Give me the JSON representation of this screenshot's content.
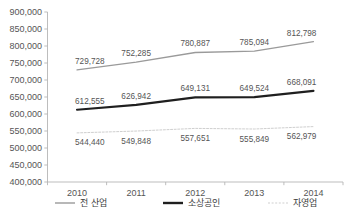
{
  "chart_data": {
    "type": "line",
    "title": "",
    "subtitle": "",
    "xlabel": "",
    "ylabel": "",
    "categories": [
      "2010",
      "2011",
      "2012",
      "2013",
      "2014"
    ],
    "ylim": [
      400000,
      900000
    ],
    "ytick_step": 50000,
    "ytick_labels": [
      "400,000",
      "450,000",
      "500,000",
      "550,000",
      "600,000",
      "650,000",
      "700,000",
      "750,000",
      "800,000",
      "850,000",
      "900,000"
    ],
    "grid": false,
    "legend_position": "bottom",
    "series": [
      {
        "name": "전 산업",
        "color": "#9a9a9a",
        "width": 1.3,
        "dash": "none",
        "values": [
          729728,
          752285,
          780887,
          785094,
          812798
        ],
        "labels": [
          "729,728",
          "752,285",
          "780,887",
          "785,094",
          "812,798"
        ]
      },
      {
        "name": "소상공인",
        "color": "#1f1f1f",
        "width": 2.2,
        "dash": "none",
        "values": [
          612555,
          626942,
          649131,
          649524,
          668091
        ],
        "labels": [
          "612,555",
          "626,942",
          "649,131",
          "649,524",
          "668,091"
        ]
      },
      {
        "name": "자영업",
        "color": "#cfcfcf",
        "width": 1.0,
        "dash": "2,1.6",
        "values": [
          544440,
          549848,
          557651,
          555849,
          562979
        ],
        "labels": [
          "544,440",
          "549,848",
          "557,651",
          "555,849",
          "562,979"
        ]
      }
    ]
  },
  "axis": {
    "axis_color": "#b6b6b6",
    "tick_color": "#b6b6b6"
  },
  "legend": {
    "items": [
      {
        "label": "전 산업",
        "color": "#9a9a9a",
        "dash": "none",
        "width": 1.4
      },
      {
        "label": "소상공인",
        "color": "#1f1f1f",
        "dash": "none",
        "width": 2.4
      },
      {
        "label": "자영업",
        "color": "#cfcfcf",
        "dash": "2,1.6",
        "width": 1.2
      }
    ]
  }
}
